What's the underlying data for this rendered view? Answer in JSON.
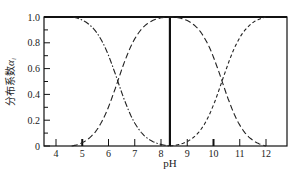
{
  "chart_data": {
    "type": "line",
    "title": "",
    "xlabel": "pH",
    "ylabel": "分布系数α_i",
    "ylabel_main": "分布系数",
    "ylabel_symbol": "α",
    "ylabel_sub": "i",
    "xlim": [
      3.5,
      12.8
    ],
    "ylim": [
      0,
      1.0
    ],
    "x_ticks": [
      4,
      5,
      6,
      7,
      8,
      9,
      10,
      11,
      12
    ],
    "x_tick_labels": [
      "4",
      "5",
      "6",
      "7",
      "8",
      "9",
      "10",
      "11",
      "12"
    ],
    "y_ticks": [
      0,
      0.2,
      0.4,
      0.6,
      0.8,
      1.0
    ],
    "y_tick_labels": [
      "0",
      "0.2",
      "0.4",
      "0.6",
      "0.8",
      "1.0"
    ],
    "y_minor_ticks": [
      0.1,
      0.3,
      0.5,
      0.7,
      0.9
    ],
    "grid": false,
    "legend": null,
    "vertical_marker": {
      "x": 8.34,
      "style": "solid-thick"
    },
    "crossings": [
      {
        "x": 6.35,
        "y": 0.5
      },
      {
        "x": 10.33,
        "y": 0.5
      }
    ],
    "x": [
      4.0,
      4.6,
      5.0,
      5.5,
      6.0,
      6.35,
      7.0,
      7.5,
      8.0,
      8.34,
      9.0,
      9.5,
      10.0,
      10.33,
      11.0,
      11.5,
      12.0
    ],
    "series": [
      {
        "name": "H2CO3 (α0)",
        "style": "dash-dot",
        "values": [
          1.0,
          0.98,
          0.96,
          0.88,
          0.69,
          0.5,
          0.18,
          0.07,
          0.02,
          0.0,
          0.0,
          0.0,
          0.0,
          0.0,
          0.0,
          0.0,
          0.0
        ]
      },
      {
        "name": "HCO3- (α1)",
        "style": "long-dash",
        "values": [
          0.0,
          0.02,
          0.04,
          0.12,
          0.31,
          0.5,
          0.82,
          0.93,
          0.97,
          1.0,
          0.95,
          0.87,
          0.68,
          0.5,
          0.18,
          0.06,
          0.02
        ]
      },
      {
        "name": "CO3 2- (α2)",
        "style": "short-dash",
        "values": [
          0.0,
          0.0,
          0.0,
          0.0,
          0.0,
          0.0,
          0.0,
          0.0,
          0.0,
          0.0,
          0.05,
          0.13,
          0.32,
          0.5,
          0.82,
          0.94,
          1.0
        ]
      }
    ]
  }
}
